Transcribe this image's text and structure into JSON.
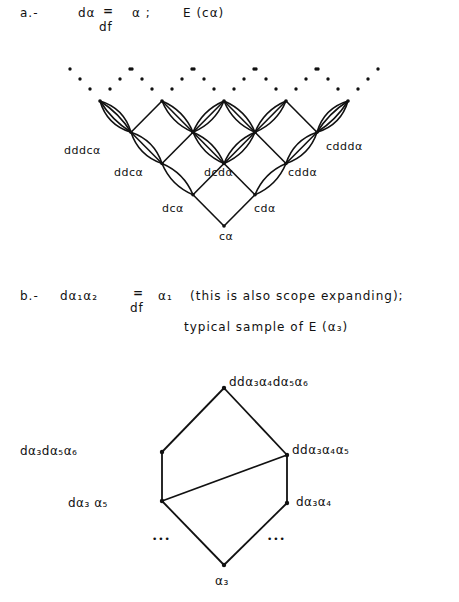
{
  "part_a": {
    "prefix": "a.-",
    "formula_lhs": "dα",
    "formula_eq": "=",
    "formula_under": "df",
    "formula_rhs": "α ;",
    "formula_set": "E (cα)",
    "labels": {
      "dddca": "dddcα",
      "cddda": "cdddα",
      "ddca": "ddcα",
      "dcda": "dcdα",
      "cdda": "cddα",
      "dca": "dcα",
      "cda": "cdα",
      "ca": "cα"
    }
  },
  "part_b": {
    "prefix": "b.-",
    "formula_lhs": "dα₁α₂",
    "formula_eq": "=",
    "formula_under": "df",
    "formula_rhs": "α₁",
    "formula_note": "(this is also scope expanding);",
    "subtitle": "typical sample of E (α₃)",
    "labels": {
      "top": "ddα₃α₄dα₅α₆",
      "left_upper": "dα₃dα₅α₆",
      "right_upper": "ddα₃α₄α₅",
      "left_lower": "dα₃ α₅",
      "right_lower": "dα₃α₄",
      "bottom": "α₃",
      "ellipsis": "•••"
    }
  }
}
